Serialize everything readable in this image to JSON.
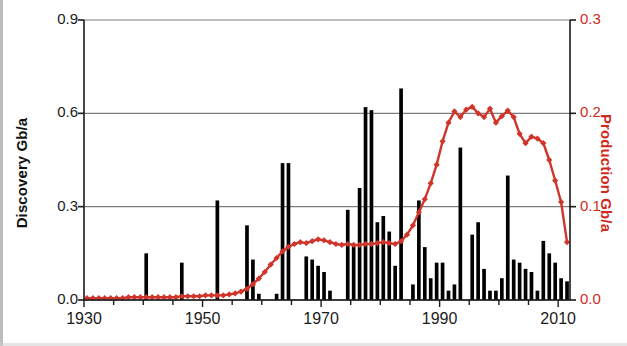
{
  "figure": {
    "background": "#ffffff",
    "bar_color": "#000000",
    "line_color": "#d0342a",
    "grid_color": "#7d7d7d",
    "axis_color": "#1b1b1b"
  },
  "chart_data": {
    "type": "bar",
    "title": "",
    "xlabel": "",
    "ylabel": "Discovery Gb/a",
    "y2label": "Production Gb/a",
    "grid": true,
    "legend": "none",
    "xlim": [
      1930,
      2012
    ],
    "ylim": [
      0.0,
      0.9
    ],
    "y2lim": [
      0.0,
      0.3
    ],
    "xticks": [
      1930,
      1950,
      1970,
      1990,
      2010
    ],
    "xtick_labels": [
      "1930",
      "1950",
      "1970",
      "1990",
      "2010"
    ],
    "yticks": [
      0.0,
      0.3,
      0.6,
      0.9
    ],
    "ytick_labels": [
      "0.0",
      "0.3",
      "0.6",
      "0.9"
    ],
    "y2ticks": [
      0.0,
      0.1,
      0.2,
      0.3
    ],
    "y2tick_labels": [
      "0.0",
      "0.1",
      "0.2",
      "0.3"
    ],
    "series": [
      {
        "name": "Discovery",
        "type": "bar",
        "axis": "left",
        "unit": "Gb/a",
        "color": "#000000",
        "x": [
          1930,
          1931,
          1932,
          1933,
          1934,
          1935,
          1936,
          1937,
          1938,
          1939,
          1940,
          1941,
          1942,
          1943,
          1944,
          1945,
          1946,
          1947,
          1948,
          1949,
          1950,
          1951,
          1952,
          1953,
          1954,
          1955,
          1956,
          1957,
          1958,
          1959,
          1960,
          1961,
          1962,
          1963,
          1964,
          1965,
          1966,
          1967,
          1968,
          1969,
          1970,
          1971,
          1972,
          1973,
          1974,
          1975,
          1976,
          1977,
          1978,
          1979,
          1980,
          1981,
          1982,
          1983,
          1984,
          1985,
          1986,
          1987,
          1988,
          1989,
          1990,
          1991,
          1992,
          1993,
          1994,
          1995,
          1996,
          1997,
          1998,
          1999,
          2000,
          2001,
          2002,
          2003,
          2004,
          2005,
          2006,
          2007,
          2008,
          2009,
          2010,
          2011
        ],
        "values": [
          0.0,
          0.0,
          0.0,
          0.0,
          0.0,
          0.0,
          0.0,
          0.0,
          0.0,
          0.0,
          0.15,
          0.0,
          0.0,
          0.0,
          0.0,
          0.0,
          0.12,
          0.0,
          0.0,
          0.0,
          0.0,
          0.0,
          0.32,
          0.0,
          0.0,
          0.0,
          0.0,
          0.24,
          0.13,
          0.02,
          0.0,
          0.0,
          0.02,
          0.44,
          0.44,
          0.0,
          0.0,
          0.14,
          0.13,
          0.11,
          0.09,
          0.03,
          0.0,
          0.0,
          0.29,
          0.18,
          0.36,
          0.62,
          0.61,
          0.25,
          0.27,
          0.22,
          0.11,
          0.68,
          0.0,
          0.05,
          0.32,
          0.17,
          0.07,
          0.12,
          0.12,
          0.03,
          0.05,
          0.49,
          0.0,
          0.21,
          0.25,
          0.1,
          0.03,
          0.03,
          0.07,
          0.4,
          0.13,
          0.12,
          0.1,
          0.09,
          0.03,
          0.19,
          0.15,
          0.12,
          0.07,
          0.06
        ]
      },
      {
        "name": "Production",
        "type": "line",
        "axis": "right",
        "unit": "Gb/a",
        "color": "#d0342a",
        "marker": "diamond",
        "x": [
          1930,
          1931,
          1932,
          1933,
          1934,
          1935,
          1936,
          1937,
          1938,
          1939,
          1940,
          1941,
          1942,
          1943,
          1944,
          1945,
          1946,
          1947,
          1948,
          1949,
          1950,
          1951,
          1952,
          1953,
          1954,
          1955,
          1956,
          1957,
          1958,
          1959,
          1960,
          1961,
          1962,
          1963,
          1964,
          1965,
          1966,
          1967,
          1968,
          1969,
          1970,
          1971,
          1972,
          1973,
          1974,
          1975,
          1976,
          1977,
          1978,
          1979,
          1980,
          1981,
          1982,
          1983,
          1984,
          1985,
          1986,
          1987,
          1988,
          1989,
          1990,
          1991,
          1992,
          1993,
          1994,
          1995,
          1996,
          1997,
          1998,
          1999,
          2000,
          2001,
          2002,
          2003,
          2004,
          2005,
          2006,
          2007,
          2008,
          2009,
          2010,
          2011
        ],
        "values": [
          0.002,
          0.002,
          0.002,
          0.002,
          0.002,
          0.002,
          0.002,
          0.003,
          0.003,
          0.003,
          0.003,
          0.003,
          0.003,
          0.003,
          0.003,
          0.003,
          0.004,
          0.004,
          0.004,
          0.004,
          0.005,
          0.005,
          0.005,
          0.005,
          0.006,
          0.007,
          0.009,
          0.012,
          0.017,
          0.023,
          0.03,
          0.038,
          0.045,
          0.052,
          0.057,
          0.06,
          0.062,
          0.061,
          0.063,
          0.065,
          0.064,
          0.062,
          0.06,
          0.059,
          0.06,
          0.059,
          0.059,
          0.06,
          0.06,
          0.061,
          0.062,
          0.061,
          0.06,
          0.063,
          0.07,
          0.08,
          0.094,
          0.108,
          0.125,
          0.145,
          0.17,
          0.19,
          0.202,
          0.196,
          0.204,
          0.207,
          0.2,
          0.196,
          0.205,
          0.19,
          0.197,
          0.203,
          0.196,
          0.178,
          0.168,
          0.175,
          0.173,
          0.168,
          0.15,
          0.128,
          0.105,
          0.062
        ]
      }
    ]
  },
  "axes": {
    "left_title": "Discovery Gb/a",
    "right_title": "Production Gb/a"
  }
}
